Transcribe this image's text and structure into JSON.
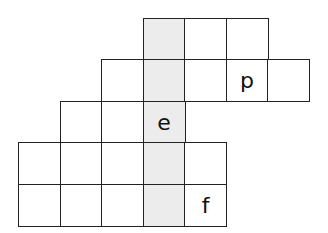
{
  "puzzle": {
    "origin_x": 18,
    "origin_y": 17.5,
    "cell_size": 41.5,
    "shaded_color": "#ececec",
    "shaded_column": 3,
    "rows": [
      {
        "cols": [
          3,
          4,
          5
        ],
        "letters": {}
      },
      {
        "cols": [
          2,
          3,
          4,
          5,
          6
        ],
        "letters": {
          "5": "p"
        }
      },
      {
        "cols": [
          1,
          2,
          3
        ],
        "letters": {
          "3": "e"
        }
      },
      {
        "cols": [
          0,
          1,
          2,
          3,
          4
        ],
        "letters": {}
      },
      {
        "cols": [
          0,
          1,
          2,
          3,
          4
        ],
        "letters": {
          "4": "f"
        }
      }
    ]
  }
}
